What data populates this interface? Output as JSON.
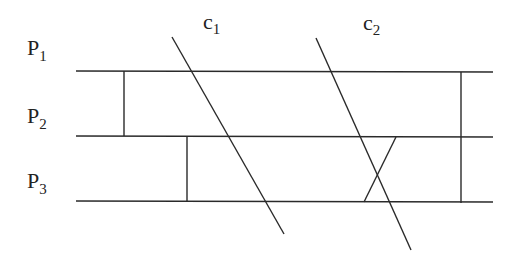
{
  "diagram": {
    "type": "space-time-diagram",
    "processes": [
      {
        "id": "P1",
        "label_main": "P",
        "label_sub": "1",
        "y": 71
      },
      {
        "id": "P2",
        "label_main": "P",
        "label_sub": "2",
        "y": 136
      },
      {
        "id": "P3",
        "label_main": "P",
        "label_sub": "3",
        "y": 201
      }
    ],
    "cuts": [
      {
        "id": "c1",
        "label_main": "c",
        "label_sub": "1",
        "x1": 172,
        "y1": 37,
        "x2": 284,
        "y2": 234
      },
      {
        "id": "c2",
        "label_main": "c",
        "label_sub": "2",
        "x1": 316,
        "y1": 38,
        "x2": 411,
        "y2": 250
      }
    ],
    "messages": [
      {
        "from": "P1",
        "to": "P2",
        "x1": 124,
        "y1": 71,
        "x2": 124,
        "y2": 136
      },
      {
        "from": "P2",
        "to": "P3",
        "x1": 187,
        "y1": 136,
        "x2": 187,
        "y2": 201
      },
      {
        "from": "P2",
        "to": "P3",
        "x1": 396,
        "y1": 137,
        "x2": 364,
        "y2": 202
      },
      {
        "from": "P1",
        "to": "P3",
        "x1": 461,
        "y1": 72,
        "x2": 461,
        "y2": 203
      }
    ],
    "colors": {
      "line": "#2a2a2a",
      "text": "#222222",
      "background": "#ffffff"
    }
  }
}
